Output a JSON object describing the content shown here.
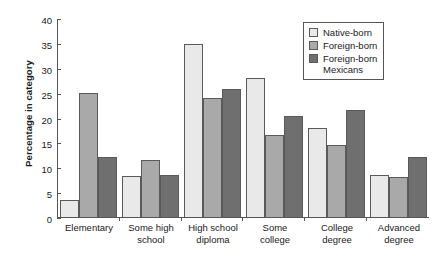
{
  "chart_data": {
    "type": "bar",
    "title": "",
    "xlabel": "Level of education",
    "ylabel": "Percentage in category",
    "ylim": [
      0,
      40
    ],
    "yticks": [
      0,
      5,
      10,
      15,
      20,
      25,
      30,
      35,
      40
    ],
    "grid": false,
    "legend_position": "top-right",
    "categories": [
      "Elementary",
      "Some high\nschool",
      "High school\ndiploma",
      "Some\ncollege",
      "College\ndegree",
      "Advanced\ndegree"
    ],
    "series": [
      {
        "name": "Native-born",
        "color": "#e9e9e9",
        "values": [
          3.4,
          8.3,
          34.8,
          28.0,
          17.8,
          8.5
        ]
      },
      {
        "name": "Foreign-born",
        "color": "#a9a9a9",
        "values": [
          25.0,
          11.5,
          24.0,
          16.5,
          14.5,
          8.0
        ]
      },
      {
        "name": "Foreign-born\nMexicans",
        "color": "#6f6f6f",
        "values": [
          12.0,
          8.5,
          25.7,
          20.4,
          21.5,
          12.1
        ]
      }
    ]
  },
  "axis": {
    "y_title": "Percentage in category",
    "x_title": "Level of education"
  }
}
